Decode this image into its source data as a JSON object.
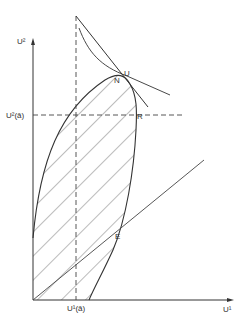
{
  "diagram": {
    "axes": {
      "x_label": "U¹",
      "y_label": "U²"
    },
    "reference_lines": {
      "vertical_label": "U¹(ā)",
      "horizontal_label": "U²(ā)"
    },
    "points": {
      "U": "U",
      "N": "N",
      "R": "R",
      "E": "E"
    },
    "colors": {
      "line": "#333333",
      "hatch": "#555555",
      "background": "#ffffff"
    }
  }
}
